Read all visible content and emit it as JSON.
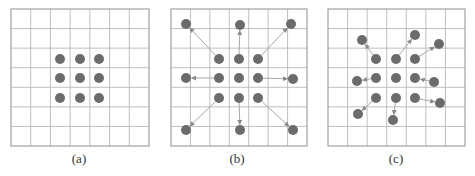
{
  "figure": {
    "grid_size": 7,
    "colors": {
      "grid_line": "#b8b8b8",
      "grid_border": "#9a9a9a",
      "dot": "#6b6b6b",
      "arrow": "#a8a8a8",
      "caption": "#333333"
    },
    "dot_radius": 5,
    "panels": [
      {
        "id": "a",
        "caption": "(a)",
        "caption_x": 79,
        "grid": {
          "x0": 11,
          "y0": 9,
          "x1": 149,
          "y1": 146
        },
        "sample_points": [
          [
            60,
            59
          ],
          [
            80,
            59
          ],
          [
            99,
            59
          ],
          [
            60,
            78
          ],
          [
            80,
            78
          ],
          [
            99,
            78
          ],
          [
            60,
            98
          ],
          [
            80,
            98
          ],
          [
            99,
            98
          ]
        ],
        "offset_points": [],
        "arrows": []
      },
      {
        "id": "b",
        "caption": "(b)",
        "caption_x": 237,
        "grid": {
          "x0": 171,
          "y0": 9,
          "x1": 307,
          "y1": 146
        },
        "sample_points": [
          [
            219,
            59
          ],
          [
            239,
            59
          ],
          [
            258,
            59
          ],
          [
            219,
            78
          ],
          [
            239,
            78
          ],
          [
            258,
            78
          ],
          [
            219,
            98
          ],
          [
            239,
            98
          ],
          [
            258,
            98
          ]
        ],
        "offset_points": [
          [
            186,
            24
          ],
          [
            240,
            25
          ],
          [
            291,
            24
          ],
          [
            186,
            78
          ],
          [
            293,
            79
          ],
          [
            186,
            130
          ],
          [
            240,
            130
          ],
          [
            293,
            130
          ]
        ],
        "arrows": [
          [
            [
              219,
              59
            ],
            [
              186,
              24
            ]
          ],
          [
            [
              239,
              59
            ],
            [
              240,
              25
            ]
          ],
          [
            [
              258,
              59
            ],
            [
              291,
              24
            ]
          ],
          [
            [
              219,
              78
            ],
            [
              186,
              78
            ]
          ],
          [
            [
              258,
              78
            ],
            [
              293,
              79
            ]
          ],
          [
            [
              219,
              98
            ],
            [
              186,
              130
            ]
          ],
          [
            [
              239,
              98
            ],
            [
              240,
              130
            ]
          ],
          [
            [
              258,
              98
            ],
            [
              293,
              130
            ]
          ]
        ]
      },
      {
        "id": "c",
        "caption": "(c)",
        "caption_x": 396,
        "grid": {
          "x0": 328,
          "y0": 9,
          "x1": 465,
          "y1": 146
        },
        "sample_points": [
          [
            376,
            59
          ],
          [
            396,
            59
          ],
          [
            415,
            59
          ],
          [
            376,
            78
          ],
          [
            396,
            78
          ],
          [
            415,
            78
          ],
          [
            376,
            98
          ],
          [
            396,
            98
          ],
          [
            415,
            98
          ]
        ],
        "offset_points": [
          [
            362,
            40
          ],
          [
            415,
            35
          ],
          [
            439,
            44
          ],
          [
            357,
            81
          ],
          [
            434,
            82
          ],
          [
            358,
            114
          ],
          [
            393,
            120
          ],
          [
            440,
            103
          ]
        ],
        "arrows": [
          [
            [
              376,
              59
            ],
            [
              362,
              40
            ]
          ],
          [
            [
              396,
              59
            ],
            [
              415,
              35
            ]
          ],
          [
            [
              415,
              59
            ],
            [
              439,
              44
            ]
          ],
          [
            [
              376,
              78
            ],
            [
              357,
              81
            ]
          ],
          [
            [
              434,
              82
            ],
            [
              415,
              78
            ]
          ],
          [
            [
              376,
              98
            ],
            [
              358,
              114
            ]
          ],
          [
            [
              396,
              98
            ],
            [
              393,
              120
            ]
          ],
          [
            [
              415,
              98
            ],
            [
              440,
              103
            ]
          ]
        ]
      }
    ]
  }
}
